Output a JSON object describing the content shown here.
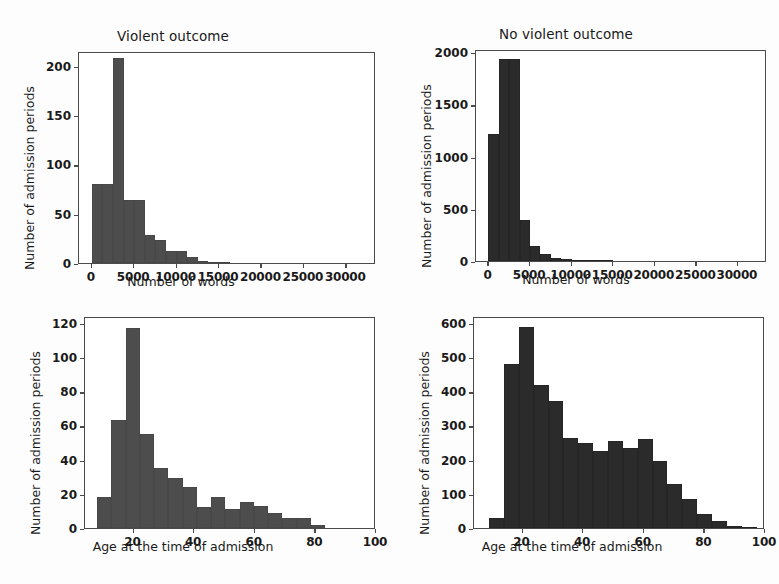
{
  "figure": {
    "bar_color": "#4d4d4d",
    "bar_color_dark": "#2b2b2b",
    "axis_color": "#4a4a4a"
  },
  "chart_data": [
    {
      "id": "violent-words",
      "type": "bar",
      "title": "Violent outcome",
      "xlabel": "Number of words",
      "ylabel": "Number of admission periods",
      "xlim": [
        -1500,
        33500
      ],
      "ylim": [
        0,
        215
      ],
      "xticks": [
        0,
        5000,
        10000,
        15000,
        20000,
        25000,
        30000
      ],
      "xticklabels": [
        "0",
        "5000",
        "10000",
        "15000",
        "20000",
        "25000",
        "30000"
      ],
      "yticks": [
        0,
        50,
        100,
        150,
        200
      ],
      "yticklabels": [
        "0",
        "50",
        "100",
        "150",
        "200"
      ],
      "grid": false,
      "bin_edges": [
        0,
        1250,
        2500,
        3750,
        5000,
        6250,
        7500,
        8750,
        10000,
        11250,
        12500,
        13750,
        15000,
        16250
      ],
      "values": [
        80,
        80,
        208,
        64,
        64,
        28,
        23,
        12,
        12,
        6,
        2,
        1,
        1
      ]
    },
    {
      "id": "nonviolent-words",
      "type": "bar",
      "title": "No violent outcome",
      "xlabel": "Number of words",
      "ylabel": "Number of admission periods",
      "xlim": [
        -1500,
        33500
      ],
      "ylim": [
        0,
        2030
      ],
      "xticks": [
        0,
        5000,
        10000,
        15000,
        20000,
        25000,
        30000
      ],
      "xticklabels": [
        "0",
        "5000",
        "10000",
        "15000",
        "20000",
        "25000",
        "30000"
      ],
      "yticks": [
        0,
        500,
        1000,
        1500,
        2000
      ],
      "yticklabels": [
        "0",
        "500",
        "1000",
        "1500",
        "2000"
      ],
      "grid": false,
      "bin_edges": [
        0,
        1250,
        2500,
        3750,
        5000,
        6250,
        7500,
        8750,
        10000,
        11250,
        12500,
        13750,
        15000
      ],
      "values": [
        1220,
        1935,
        1935,
        395,
        145,
        70,
        25,
        15,
        10,
        8,
        5,
        3
      ]
    },
    {
      "id": "violent-age",
      "type": "bar",
      "title": "",
      "xlabel": "Age at the time of admission",
      "ylabel": "Number of admission periods",
      "xlim": [
        4,
        100
      ],
      "ylim": [
        0,
        124
      ],
      "xticks": [
        20,
        40,
        60,
        80,
        100
      ],
      "xticklabels": [
        "20",
        "40",
        "60",
        "80",
        "100"
      ],
      "yticks": [
        0,
        20,
        40,
        60,
        80,
        100,
        120
      ],
      "yticklabels": [
        "0",
        "20",
        "40",
        "60",
        "80",
        "100",
        "120"
      ],
      "grid": false,
      "bin_edges": [
        8,
        12.7,
        17.4,
        22.1,
        26.8,
        31.5,
        36.2,
        40.9,
        45.6,
        50.3,
        55,
        59.7,
        64.4,
        69.1,
        73.8,
        78.5,
        83.2
      ],
      "values": [
        18,
        63,
        117,
        55,
        35,
        29,
        24,
        12,
        18,
        11,
        15,
        13,
        9,
        6,
        6,
        2
      ]
    },
    {
      "id": "nonviolent-age",
      "type": "bar",
      "title": "",
      "xlabel": "Age at the time of admission",
      "ylabel": "Number of admission periods",
      "xlim": [
        4,
        100
      ],
      "ylim": [
        0,
        620
      ],
      "xticks": [
        20,
        40,
        60,
        80,
        100
      ],
      "xticklabels": [
        "20",
        "40",
        "60",
        "80",
        "100"
      ],
      "yticks": [
        0,
        100,
        200,
        300,
        400,
        500,
        600
      ],
      "yticklabels": [
        "0",
        "100",
        "200",
        "300",
        "400",
        "500",
        "600"
      ],
      "grid": false,
      "bin_edges": [
        9,
        13.9,
        18.8,
        23.7,
        28.6,
        33.5,
        38.4,
        43.3,
        48.2,
        53.1,
        58,
        62.9,
        67.8,
        72.7,
        77.6,
        82.5,
        87.4,
        92.3,
        97.2
      ],
      "values": [
        28,
        480,
        588,
        418,
        370,
        262,
        250,
        225,
        255,
        235,
        260,
        196,
        130,
        85,
        42,
        20,
        6,
        4
      ]
    }
  ]
}
